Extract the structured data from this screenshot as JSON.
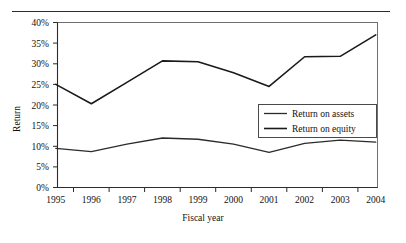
{
  "chart_data": {
    "type": "line",
    "title": "",
    "xlabel": "Fiscal year",
    "ylabel": "Return",
    "categories": [
      "1995",
      "1996",
      "1997",
      "1998",
      "1999",
      "2000",
      "2001",
      "2002",
      "2003",
      "2004"
    ],
    "x": [
      1995,
      1996,
      1997,
      1998,
      1999,
      2000,
      2001,
      2002,
      2003,
      2004
    ],
    "series": [
      {
        "name": "Return on assets",
        "values": [
          9.5,
          8.7,
          10.5,
          12.0,
          11.7,
          10.5,
          8.5,
          10.7,
          11.5,
          11.0
        ],
        "color": "#2b2b2b"
      },
      {
        "name": "Return on equity",
        "values": [
          25.0,
          20.3,
          25.5,
          30.7,
          30.5,
          27.8,
          24.5,
          31.7,
          31.8,
          37.0
        ],
        "color": "#1a1a1a"
      }
    ],
    "ylim": [
      0,
      40
    ],
    "ytick_values": [
      0,
      5,
      10,
      15,
      20,
      25,
      30,
      35,
      40
    ],
    "ytick_labels": [
      "0%",
      "5%",
      "10%",
      "15%",
      "20%",
      "25%",
      "30%",
      "35%",
      "40%"
    ],
    "xtick_labels": [
      "1995",
      "1996",
      "1997",
      "1998",
      "1999",
      "2000",
      "2001",
      "2002",
      "2003",
      "2004"
    ],
    "grid": false,
    "legend_position": "bottom-right-inside",
    "units": "percent"
  },
  "axes": {
    "y_title": "Return",
    "x_title": "Fiscal year"
  },
  "legend": {
    "entries": [
      {
        "label": "Return on assets"
      },
      {
        "label": "Return on equity"
      }
    ]
  }
}
